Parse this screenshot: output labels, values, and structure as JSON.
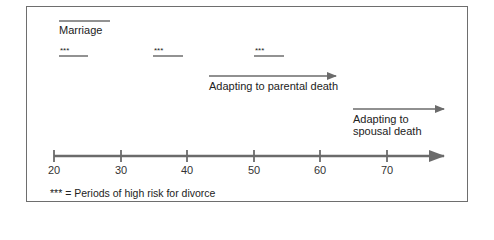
{
  "diagram": {
    "type": "timeline",
    "marriage": {
      "label": "Marriage",
      "bar_x": [
        59,
        110
      ],
      "bar_y": 21
    },
    "risk_periods": [
      {
        "marker": "***",
        "x": [
          59,
          88
        ],
        "y": 56
      },
      {
        "marker": "***",
        "x": [
          153,
          183
        ],
        "y": 56
      },
      {
        "marker": "***",
        "x": [
          254,
          284
        ],
        "y": 56
      }
    ],
    "arrows": [
      {
        "label": "Adapting to parental death",
        "x": [
          209,
          336
        ],
        "y": 76
      },
      {
        "label_line1": "Adapting to",
        "label_line2": "spousal death",
        "x": [
          353,
          444
        ],
        "y": 109
      }
    ],
    "axis": {
      "y": 156,
      "x_start": 54,
      "x_end": 444,
      "ticks": [
        {
          "label": "20",
          "x": 54
        },
        {
          "label": "30",
          "x": 121
        },
        {
          "label": "40",
          "x": 187
        },
        {
          "label": "50",
          "x": 254
        },
        {
          "label": "60",
          "x": 320
        },
        {
          "label": "70",
          "x": 387
        }
      ]
    },
    "legend": "*** = Periods of high risk for divorce",
    "colors": {
      "line": "#6e6e6e",
      "arrow": "#6b6b6b",
      "text": "#222222"
    }
  }
}
